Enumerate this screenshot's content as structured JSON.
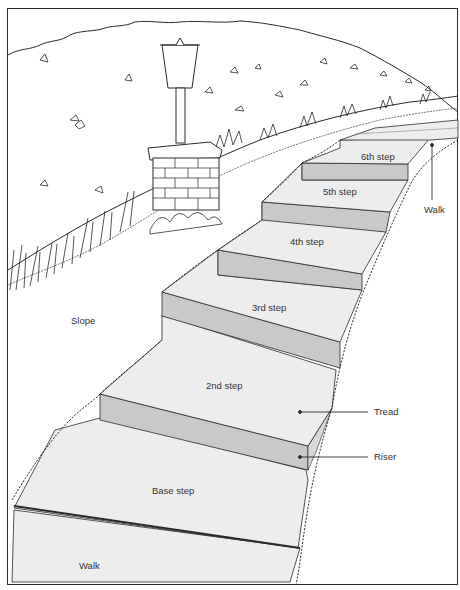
{
  "diagram": {
    "labels": {
      "step6": "6th step",
      "step5": "5th step",
      "step4": "4th step",
      "step3": "3rd step",
      "step2": "2nd step",
      "base": "Base step",
      "walk_bottom": "Walk",
      "walk_top": "Walk",
      "slope": "Slope",
      "tread": "Tread",
      "riser": "Riser"
    },
    "colors": {
      "tread": "#ededed",
      "riser": "#c9c9c9",
      "line": "#2a2a2a",
      "background": "#ffffff"
    }
  }
}
